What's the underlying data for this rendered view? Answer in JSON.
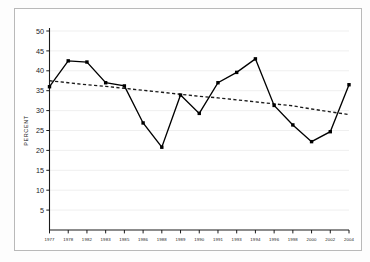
{
  "chart_data": {
    "type": "line",
    "title": "",
    "xlabel": "",
    "ylabel": "PERCENT",
    "ylim": [
      0,
      50
    ],
    "yticks": [
      5,
      10,
      15,
      20,
      25,
      30,
      35,
      40,
      45,
      50
    ],
    "grid": true,
    "grid_axis": "y",
    "legend": null,
    "categories": [
      "1977",
      "1978",
      "1982",
      "1983",
      "1985",
      "1986",
      "1988",
      "1989",
      "1990",
      "1991",
      "1993",
      "1994",
      "1996",
      "1998",
      "2000",
      "2002",
      "2004"
    ],
    "series": [
      {
        "name": "Percent",
        "style": "solid-with-square-markers",
        "color": "#000000",
        "values": [
          36.0,
          42.5,
          42.2,
          37.0,
          36.2,
          26.9,
          20.8,
          33.9,
          29.3,
          37.0,
          39.6,
          43.0,
          31.3,
          26.4,
          22.2,
          24.7,
          36.5
        ]
      },
      {
        "name": "Trend",
        "style": "dashed",
        "color": "#1a1a1a",
        "values": [
          37.5,
          37.0,
          36.5,
          36.1,
          35.6,
          35.1,
          34.6,
          34.1,
          33.6,
          33.2,
          32.7,
          32.2,
          31.7,
          31.2,
          30.4,
          29.7,
          29.0
        ]
      }
    ]
  },
  "colors": {
    "line": "#000000",
    "trend": "#1a1a1a",
    "grid": "#ededed",
    "axis": "#1a1a1a",
    "frame": "#b9b9b9",
    "background": "#ffffff"
  }
}
